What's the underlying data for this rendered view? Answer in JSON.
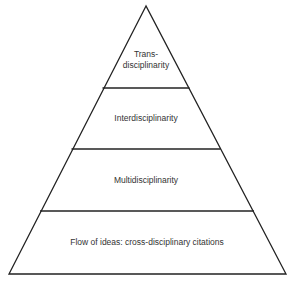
{
  "diagram": {
    "type": "pyramid",
    "levels": [
      {
        "id": "top",
        "label_line1": "Trans-",
        "label_line2": "disciplinarity"
      },
      {
        "id": "level2",
        "label": "Interdisciplinarity"
      },
      {
        "id": "level3",
        "label": "Multidisciplinarity"
      },
      {
        "id": "base",
        "label": "Flow of ideas: cross-disciplinary citations"
      }
    ],
    "stroke_color": "#222222"
  }
}
